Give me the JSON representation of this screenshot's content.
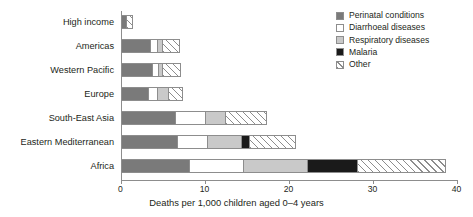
{
  "chart_data": {
    "type": "bar",
    "orientation": "horizontal",
    "stacked": true,
    "title": "",
    "xlabel": "Deaths per 1,000 children aged 0–4 years",
    "ylabel": "",
    "xlim": [
      0,
      40
    ],
    "xticks": [
      0,
      10,
      20,
      30,
      40
    ],
    "xticklabels": [
      "0",
      "10",
      "20",
      "30",
      "40"
    ],
    "grid": false,
    "legend_position": "top-right",
    "categories": [
      "High income",
      "Americas",
      "Western Pacific",
      "Europe",
      "South-East Asia",
      "Eastern Mediterranean",
      "Africa"
    ],
    "series": [
      {
        "name": "Perinatal conditions",
        "color": "#7a7a7a",
        "pattern": "solid",
        "values": [
          0.6,
          3.5,
          3.8,
          3.3,
          6.5,
          6.7,
          8.1
        ]
      },
      {
        "name": "Diarrhoeal diseases",
        "color": "#ffffff",
        "pattern": "solid",
        "values": [
          0.0,
          0.8,
          0.7,
          1.1,
          3.6,
          3.6,
          6.5
        ]
      },
      {
        "name": "Respiratory diseases",
        "color": "#c9c9c9",
        "pattern": "solid",
        "values": [
          0.0,
          0.7,
          0.4,
          1.2,
          2.4,
          4.0,
          7.6
        ]
      },
      {
        "name": "Malaria",
        "color": "#1a1a1a",
        "pattern": "solid",
        "values": [
          0.0,
          0.0,
          0.0,
          0.0,
          0.0,
          1.0,
          6.0
        ]
      },
      {
        "name": "Other",
        "color": "#ffffff",
        "pattern": "diagonal-hatch",
        "values": [
          0.9,
          2.1,
          2.3,
          1.9,
          4.9,
          5.6,
          10.5
        ]
      }
    ],
    "totals": [
      1.5,
      7.1,
      7.2,
      7.5,
      17.4,
      20.9,
      38.7
    ]
  },
  "legend": {
    "items": [
      {
        "label": "Perinatal conditions",
        "swatch_name": "legend-swatch-perinatal-conditions"
      },
      {
        "label": "Diarrhoeal diseases",
        "swatch_name": "legend-swatch-diarrhoeal-diseases"
      },
      {
        "label": "Respiratory diseases",
        "swatch_name": "legend-swatch-respiratory-diseases"
      },
      {
        "label": "Malaria",
        "swatch_name": "legend-swatch-malaria"
      },
      {
        "label": "Other",
        "swatch_name": "legend-swatch-other"
      }
    ]
  },
  "colors": {
    "perinatal": "#7a7a7a",
    "diarrhoeal": "#ffffff",
    "respiratory": "#c9c9c9",
    "malaria": "#1a1a1a",
    "other": "#ffffff",
    "outline": "#8d8d8d",
    "text": "#231f20",
    "background": "#ffffff"
  }
}
